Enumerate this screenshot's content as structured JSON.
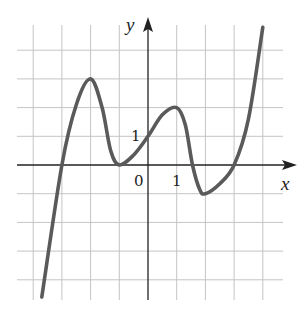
{
  "chart_data": {
    "type": "line",
    "title": "",
    "xlabel": "x",
    "ylabel": "y",
    "xlim": [
      -4.5,
      4.5
    ],
    "ylim": [
      -4.7,
      4.9
    ],
    "grid": true,
    "tick_labels": {
      "origin": "0",
      "x_one": "1",
      "y_one": "1"
    },
    "series": [
      {
        "name": "f(x)",
        "color": "#5a5a5a",
        "x": [
          -3.7,
          -3.0,
          -2.5,
          -2.0,
          -1.6,
          -1.3,
          -1.0,
          -0.5,
          0.0,
          0.5,
          1.0,
          1.3,
          1.55,
          1.8,
          2.0,
          2.5,
          3.0,
          3.5,
          4.0
        ],
        "y": [
          -4.6,
          0.0,
          2.1,
          3.0,
          2.0,
          0.5,
          0.0,
          0.35,
          1.0,
          1.75,
          2.0,
          1.4,
          0.0,
          -0.85,
          -1.0,
          -0.65,
          0.0,
          1.6,
          4.8
        ]
      }
    ],
    "key_points": [
      {
        "label": "x-intercept",
        "x": -3,
        "y": 0
      },
      {
        "label": "local max",
        "x": -2,
        "y": 3
      },
      {
        "label": "local min (touches axis)",
        "x": -1,
        "y": 0
      },
      {
        "label": "y-intercept",
        "x": 0,
        "y": 1
      },
      {
        "label": "local max",
        "x": 1,
        "y": 2
      },
      {
        "label": "local min",
        "x": 2,
        "y": -1
      },
      {
        "label": "x-intercept",
        "x": 3,
        "y": 0
      }
    ],
    "colors": {
      "grid": "#c4c4c4",
      "axes": "#222222",
      "curve": "#5a5a5a"
    }
  },
  "labels": {
    "x_axis": "x",
    "y_axis": "y",
    "origin": "0",
    "x_tick_1": "1",
    "y_tick_1": "1"
  }
}
